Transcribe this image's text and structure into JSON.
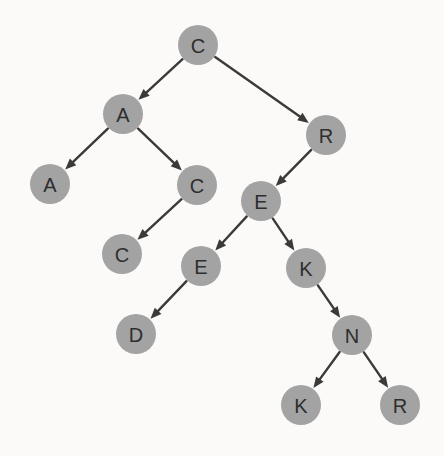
{
  "diagram": {
    "type": "binary-search-tree",
    "background_color": "#fbfaf8",
    "node_fill_color": "#a3a3a3",
    "node_label_color": "#2e2e2e",
    "edge_color": "#3a3a3a",
    "node_radius": 20,
    "nodes": [
      {
        "id": "n0",
        "label": "C",
        "x": 198,
        "y": 45
      },
      {
        "id": "n1",
        "label": "A",
        "x": 123,
        "y": 114
      },
      {
        "id": "n2",
        "label": "R",
        "x": 326,
        "y": 135
      },
      {
        "id": "n3",
        "label": "A",
        "x": 50,
        "y": 184
      },
      {
        "id": "n4",
        "label": "C",
        "x": 197,
        "y": 185
      },
      {
        "id": "n5",
        "label": "E",
        "x": 261,
        "y": 201
      },
      {
        "id": "n6",
        "label": "C",
        "x": 122,
        "y": 254
      },
      {
        "id": "n7",
        "label": "E",
        "x": 201,
        "y": 266
      },
      {
        "id": "n8",
        "label": "K",
        "x": 306,
        "y": 268
      },
      {
        "id": "n9",
        "label": "D",
        "x": 136,
        "y": 334
      },
      {
        "id": "n10",
        "label": "N",
        "x": 352,
        "y": 335
      },
      {
        "id": "n11",
        "label": "K",
        "x": 301,
        "y": 405
      },
      {
        "id": "n12",
        "label": "R",
        "x": 400,
        "y": 405
      }
    ],
    "edges": [
      {
        "from": "n0",
        "to": "n1",
        "direction": "left"
      },
      {
        "from": "n0",
        "to": "n2",
        "direction": "right"
      },
      {
        "from": "n1",
        "to": "n3",
        "direction": "left"
      },
      {
        "from": "n1",
        "to": "n4",
        "direction": "right"
      },
      {
        "from": "n2",
        "to": "n5",
        "direction": "left"
      },
      {
        "from": "n4",
        "to": "n6",
        "direction": "left"
      },
      {
        "from": "n5",
        "to": "n7",
        "direction": "left"
      },
      {
        "from": "n5",
        "to": "n8",
        "direction": "right"
      },
      {
        "from": "n7",
        "to": "n9",
        "direction": "left"
      },
      {
        "from": "n8",
        "to": "n10",
        "direction": "right"
      },
      {
        "from": "n10",
        "to": "n11",
        "direction": "left"
      },
      {
        "from": "n10",
        "to": "n12",
        "direction": "right"
      }
    ]
  }
}
